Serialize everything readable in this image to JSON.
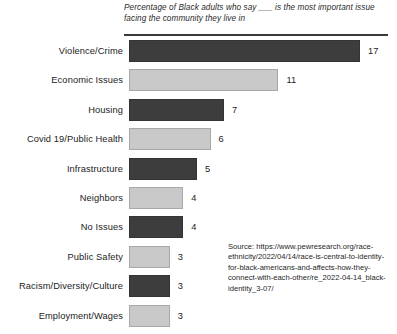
{
  "chart_data": {
    "type": "bar",
    "orientation": "horizontal",
    "title": "Percentage of Black adults who say ___ is the most important issue facing the community they live in",
    "subtitle": "",
    "xlabel": "",
    "ylabel": "",
    "xlim": [
      0,
      17
    ],
    "grid": false,
    "legend": null,
    "categories": [
      "Violence/Crime",
      "Economic Issues",
      "Housing",
      "Covid 19/Public Health",
      "Infrastructure",
      "Neighbors",
      "No Issues",
      "Public Safety",
      "Racism/Diversity/Culture",
      "Employment/Wages"
    ],
    "values": [
      17,
      11,
      7,
      6,
      5,
      4,
      4,
      3,
      3,
      3
    ],
    "value_labels": [
      "17",
      "11",
      "7",
      "6",
      "5",
      "4",
      "4",
      "3",
      "3",
      "3"
    ],
    "bar_colors": [
      "#3d3d3d",
      "#c9c9c9",
      "#3d3d3d",
      "#c9c9c9",
      "#3d3d3d",
      "#c9c9c9",
      "#3d3d3d",
      "#c9c9c9",
      "#3d3d3d",
      "#c9c9c9"
    ],
    "annotations": [
      "Source: https://www.pewresearch.org/race-ethnicity/2022/04/14/race-is-central-to-identity-for-black-americans-and-affects-how-they-connect-with-each-other/re_2022-04-14_black-identity_3-07/"
    ]
  },
  "figure": {
    "background_color": "#ffffff",
    "rule_color": "#3a3a3a",
    "text_color": "#1c1c1c",
    "dark_bar_color": "#3d3d3d",
    "light_bar_color": "#c9c9c9"
  },
  "source": {
    "text": "Source: https://www.pewresearch.org/race-ethnicity/2022/04/14/race-is-central-to-identity-for-black-americans-and-affects-how-they-connect-with-each-other/re_2022-04-14_black-identity_3-07/"
  }
}
